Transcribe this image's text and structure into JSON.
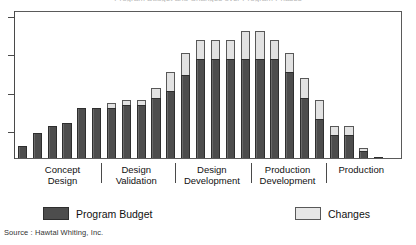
{
  "title_clipped": "Program Budget and Changes over Program Phases",
  "source": "Source : Hawtal Whiting, Inc.",
  "legend": {
    "budget_label": "Program Budget",
    "changes_label": "Changes"
  },
  "colors": {
    "budget": "#4d4d4d",
    "changes": "#e2e2e2",
    "outline": "#2e2e2e",
    "frame": "#5a5a5a",
    "background": "#ffffff"
  },
  "phases": [
    {
      "label": "Concept\nDesign",
      "center_pct": 12.5
    },
    {
      "label": "Design\nValidation",
      "center_pct": 31.5
    },
    {
      "label": "Design\nDevelopment",
      "center_pct": 51.0
    },
    {
      "label": "Production\nDevelopment",
      "center_pct": 70.5
    },
    {
      "label": "Production",
      "center_pct": 89.5
    }
  ],
  "phase_separators_pct": [
    22.5,
    41.5,
    61.0,
    80.5
  ],
  "y_ticks_pct_from_bottom": [
    18,
    44,
    70,
    96
  ],
  "chart_data": {
    "type": "bar",
    "stacked": true,
    "title": "Program Budget and Changes over Program Phases",
    "xlabel": "",
    "ylabel": "",
    "grid": false,
    "legend_position": "bottom",
    "ylim": [
      0,
      100
    ],
    "categories": [
      "1",
      "2",
      "3",
      "4",
      "5",
      "6",
      "7",
      "8",
      "9",
      "10",
      "11",
      "12",
      "13",
      "14",
      "15",
      "16",
      "17",
      "18",
      "19",
      "20",
      "21",
      "22",
      "23",
      "24",
      "25",
      "26"
    ],
    "phase_of_category": [
      "Concept Design",
      "Concept Design",
      "Concept Design",
      "Concept Design",
      "Concept Design",
      "Concept Design",
      "Design Validation",
      "Design Validation",
      "Design Validation",
      "Design Validation",
      "Design Validation",
      "Design Development",
      "Design Development",
      "Design Development",
      "Design Development",
      "Design Development",
      "Production Development",
      "Production Development",
      "Production Development",
      "Production Development",
      "Production Development",
      "Production",
      "Production",
      "Production",
      "Production",
      "Production"
    ],
    "series": [
      {
        "name": "Program Budget",
        "color": "#4d4d4d",
        "values": [
          8,
          17,
          22,
          24,
          34,
          34,
          34,
          36,
          36,
          41,
          46,
          57,
          68,
          68,
          68,
          68,
          68,
          68,
          59,
          41,
          27,
          16,
          16,
          5,
          1,
          0
        ]
      },
      {
        "name": "Changes",
        "color": "#e2e2e2",
        "values": [
          0,
          0,
          0,
          0,
          0,
          0,
          4,
          4,
          4,
          7,
          13,
          15,
          13,
          13,
          13,
          19,
          19,
          13,
          13,
          14,
          13,
          6,
          6,
          2,
          0,
          0
        ]
      }
    ],
    "totals": [
      8,
      17,
      22,
      24,
      34,
      34,
      38,
      40,
      40,
      48,
      59,
      72,
      81,
      81,
      81,
      87,
      87,
      81,
      72,
      55,
      40,
      22,
      22,
      7,
      1,
      0
    ]
  }
}
